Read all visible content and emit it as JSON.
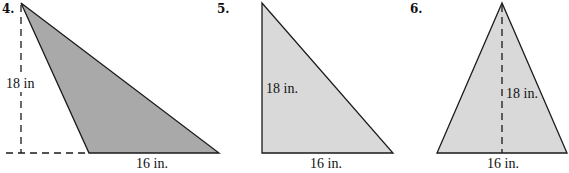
{
  "figures": [
    {
      "number": "4.",
      "height_label": "18 in",
      "base_label": "16 in.",
      "fill": "#a9a9a9"
    },
    {
      "number": "5.",
      "height_label": "18 in.",
      "base_label": "16 in.",
      "fill": "#d9d9d9"
    },
    {
      "number": "6.",
      "height_label": "18 in.",
      "base_label": "16 in.",
      "fill": "#d9d9d9"
    }
  ]
}
